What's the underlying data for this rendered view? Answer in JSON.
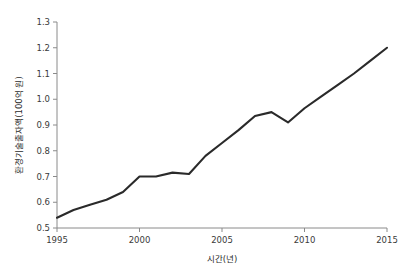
{
  "chart_data": {
    "type": "line",
    "title": "",
    "xlabel": "시간(년)",
    "ylabel": "환경기술출자액(100억 원)",
    "xlim": [
      1995,
      2015
    ],
    "ylim": [
      0.5,
      1.3
    ],
    "grid": false,
    "legend": "none",
    "line_color": "#2a2a2a",
    "axis_color": "#8a8a8a",
    "x": [
      1995,
      1996,
      1997,
      1998,
      1999,
      2000,
      2001,
      2002,
      2003,
      2004,
      2005,
      2006,
      2007,
      2008,
      2009,
      2010,
      2011,
      2012,
      2013,
      2014,
      2015
    ],
    "values": [
      0.54,
      0.57,
      0.59,
      0.61,
      0.64,
      0.7,
      0.7,
      0.715,
      0.71,
      0.78,
      0.83,
      0.88,
      0.935,
      0.95,
      0.91,
      0.965,
      1.01,
      1.055,
      1.1,
      1.15,
      1.2
    ],
    "series": [
      {
        "name": "환경기술출자액",
        "values": [
          0.54,
          0.57,
          0.59,
          0.61,
          0.64,
          0.7,
          0.7,
          0.715,
          0.71,
          0.78,
          0.83,
          0.88,
          0.935,
          0.95,
          0.91,
          0.965,
          1.01,
          1.055,
          1.1,
          1.15,
          1.2
        ]
      }
    ],
    "xticks": [
      1995,
      2000,
      2005,
      2010,
      2015
    ],
    "xtick_labels": [
      "1995",
      "2000",
      "2005",
      "2010",
      "2015"
    ],
    "yticks": [
      0.5,
      0.6,
      0.7,
      0.8,
      0.9,
      1.0,
      1.1,
      1.2,
      1.3
    ],
    "ytick_labels": [
      "0.5",
      "0.6",
      "0.7",
      "0.8",
      "0.9",
      "1.0",
      "1.1",
      "1.2",
      "1.3"
    ]
  }
}
